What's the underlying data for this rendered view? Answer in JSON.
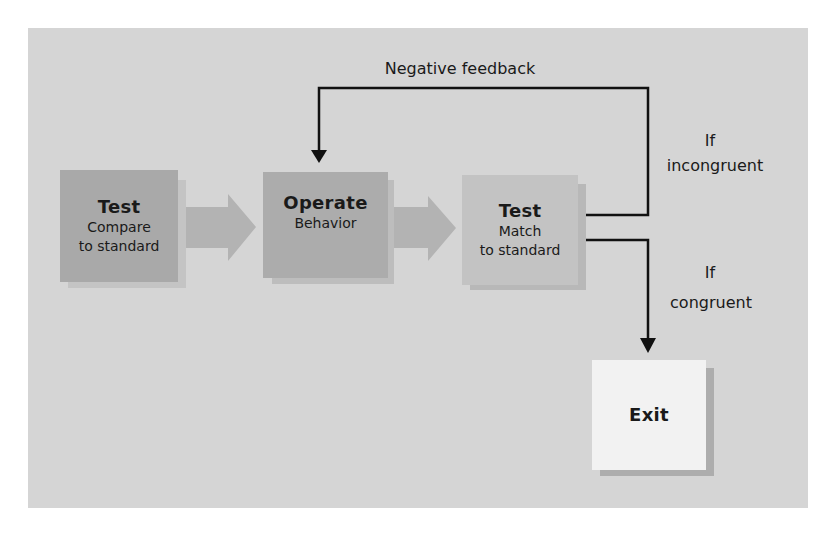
{
  "diagram": {
    "colors": {
      "panel": "#d5d5d5",
      "test1_box": "#a9a9a9",
      "operate_box": "#acacac",
      "test2_box": "#c3c3c3",
      "exit_box": "#f2f2f2",
      "arrow_fill": "#b3b3b3",
      "line": "#111111"
    },
    "nodes": [
      {
        "id": "test1",
        "title": "Test",
        "lines": [
          "Compare",
          "to standard"
        ]
      },
      {
        "id": "operate",
        "title": "Operate",
        "lines": [
          "Behavior"
        ]
      },
      {
        "id": "test2",
        "title": "Test",
        "lines": [
          "Match",
          "to standard"
        ]
      },
      {
        "id": "exit",
        "title": "Exit",
        "lines": []
      }
    ],
    "edges": [
      {
        "from": "test1",
        "to": "operate",
        "style": "block-arrow"
      },
      {
        "from": "operate",
        "to": "test2",
        "style": "block-arrow"
      },
      {
        "from": "test2",
        "to": "operate",
        "style": "line-arrow",
        "label": "Negative feedback",
        "condition": "If incongruent"
      },
      {
        "from": "test2",
        "to": "exit",
        "style": "line-arrow",
        "condition": "If congruent"
      }
    ],
    "labels": {
      "negative_feedback": "Negative feedback",
      "incongruent_if": "If",
      "incongruent_word": "incongruent",
      "congruent_if": "If",
      "congruent_word": "congruent"
    }
  }
}
